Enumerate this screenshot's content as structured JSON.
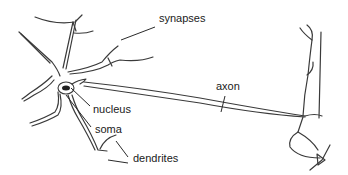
{
  "diagram": {
    "labels": {
      "synapses": "synapses",
      "axon": "axon",
      "nucleus": "nucleus",
      "soma": "soma",
      "dendrites": "dendrites"
    },
    "colors": {
      "line": "#3a3a3a",
      "text": "#1a1a1a",
      "background": "#ffffff",
      "nucleus_fill": "#222222"
    }
  }
}
